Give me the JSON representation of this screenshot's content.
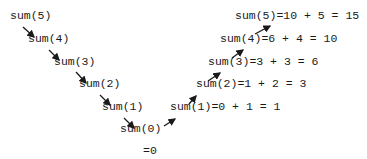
{
  "diagram": {
    "descending_calls": [
      {
        "label": "sum(5)"
      },
      {
        "label": "sum(4)"
      },
      {
        "label": "sum(3)"
      },
      {
        "label": "sum(2)"
      },
      {
        "label": "sum(1)"
      },
      {
        "label": "sum(0)"
      }
    ],
    "base_case_result": "=0",
    "returns": [
      {
        "label": "sum(1)=0 + 1 = 1"
      },
      {
        "label": "sum(2)=1 + 2 = 3"
      },
      {
        "label": "sum(3)=3 + 3 = 6"
      },
      {
        "label": "sum(4)=6 + 4 = 10"
      },
      {
        "label": "sum(5)=10 + 5 = 15"
      }
    ],
    "arrow_color": "#1a1a1a"
  }
}
